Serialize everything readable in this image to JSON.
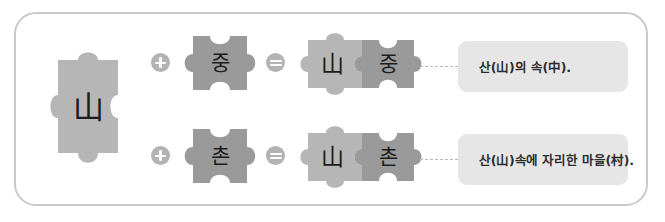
{
  "frame": {
    "border_color": "#c9c9c9",
    "background": "#ffffff"
  },
  "palette": {
    "piece_light": "#b6b6b6",
    "piece_dark": "#9a9a9a",
    "operator": "#b3b3b3",
    "caption_bg": "#e6e6e6",
    "connector": "#b9b9b9",
    "glyph": "#1c1c1c"
  },
  "pieces": {
    "base": {
      "label": "山",
      "name": "mountain-piece",
      "color": "#b6b6b6"
    },
    "addends": [
      {
        "label": "중",
        "name": "jung-piece",
        "color": "#9a9a9a"
      },
      {
        "label": "촌",
        "name": "chon-piece",
        "color": "#9a9a9a"
      }
    ],
    "results": [
      {
        "left_label": "山",
        "right_label": "중",
        "left_color": "#b6b6b6",
        "right_color": "#9a9a9a"
      },
      {
        "left_label": "山",
        "right_label": "촌",
        "left_color": "#b6b6b6",
        "right_color": "#9a9a9a"
      }
    ]
  },
  "operators": {
    "plus": "+",
    "equals": "="
  },
  "captions": [
    {
      "text": "산(山)의 속(中).",
      "name": "caption-sanjung"
    },
    {
      "text": "산(山)속에 자리한 마을(村).",
      "name": "caption-sanchon"
    }
  ]
}
